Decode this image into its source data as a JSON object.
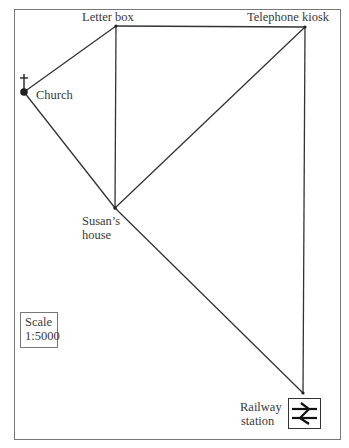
{
  "map": {
    "locations": {
      "letter_box": {
        "label": "Letter box"
      },
      "telephone_kiosk": {
        "label": "Telephone kiosk"
      },
      "church": {
        "label": "Church"
      },
      "susans_house": {
        "label_line1": "Susan’s",
        "label_line2": "house"
      },
      "railway_station": {
        "label_line1": "Railway",
        "label_line2": "station"
      }
    },
    "scale": {
      "title": "Scale",
      "value": "1:5000"
    },
    "icons": {
      "church": "cross-icon",
      "railway": "railway-station-icon"
    }
  }
}
